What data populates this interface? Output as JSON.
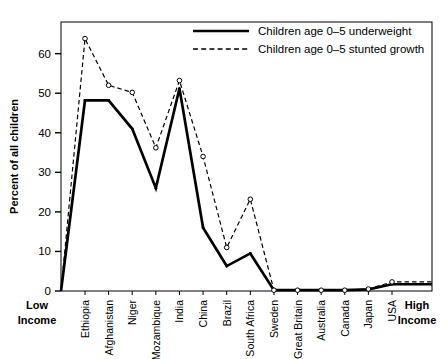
{
  "chart_data": {
    "type": "line",
    "title": "",
    "xlabel": "",
    "ylabel": "Percent of all children",
    "ylim": [
      0,
      68
    ],
    "yticks": [
      0,
      10,
      20,
      30,
      40,
      50,
      60
    ],
    "grid": false,
    "legend_position": "top-right",
    "categories": [
      "Ethiopia",
      "Afghanistan",
      "Niger",
      "Mozambique",
      "India",
      "China",
      "Brazil",
      "South Africa",
      "Sweden",
      "Great Britain",
      "Australia",
      "Canada",
      "Japan",
      "USA"
    ],
    "axis_end_labels": {
      "left_line1": "Low",
      "left_line2": "Income",
      "right_line1": "High",
      "right_line2": "Income"
    },
    "series": [
      {
        "name": "Children age 0–5 underweight",
        "style": "solid",
        "markers": false,
        "color": "#000000",
        "values": [
          48.2,
          48.2,
          41.0,
          26.0,
          51.2,
          16.0,
          6.3,
          9.5,
          0.2,
          0.2,
          0.2,
          0.2,
          0.4,
          1.7
        ]
      },
      {
        "name": "Children age 0–5 stunted growth",
        "style": "dashed",
        "markers": true,
        "color": "#000000",
        "values": [
          63.8,
          52.0,
          50.2,
          36.2,
          53.2,
          34.0,
          11.0,
          23.2,
          0.2,
          0.2,
          0.2,
          0.2,
          0.5,
          2.3
        ]
      }
    ]
  },
  "legend": {
    "entries": [
      {
        "label": "Children age 0–5 underweight",
        "style": "solid"
      },
      {
        "label": "Children age 0–5 stunted growth",
        "style": "dashed"
      }
    ]
  }
}
